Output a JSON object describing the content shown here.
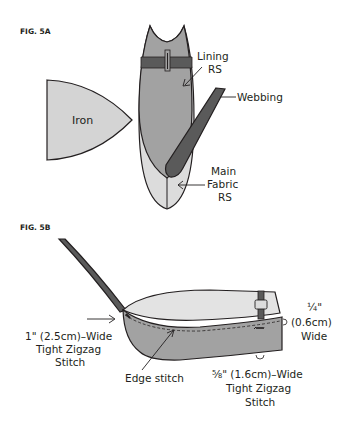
{
  "figures": [
    {
      "id": "fig-5a",
      "title": "FIG. 5A",
      "labels": {
        "iron": "Iron",
        "lining_line1": "Lining",
        "lining_line2": "RS",
        "webbing": "Webbing",
        "main_line1": "Main",
        "main_line2": "Fabric",
        "main_line3": "RS"
      }
    },
    {
      "id": "fig-5b",
      "title": "FIG. 5B",
      "labels": {
        "left_line1": "1\" (2.5cm)–Wide",
        "left_line2": "Tight Zigzag",
        "left_line3": "Stitch",
        "edge_stitch": "Edge stitch",
        "quarter_line1": "¼\"",
        "quarter_line2": "(0.6cm)",
        "quarter_line3": "Wide",
        "bottom_line1": "⅝\" (1.6cm)–Wide",
        "bottom_line2": "Tight Zigzag",
        "bottom_line3": "Stitch"
      }
    }
  ],
  "colors": {
    "light_gray": "#d9d9d9",
    "mid_gray": "#9d9d9d",
    "dark_gray": "#555555",
    "outline": "#231f20",
    "background": "#ffffff"
  }
}
